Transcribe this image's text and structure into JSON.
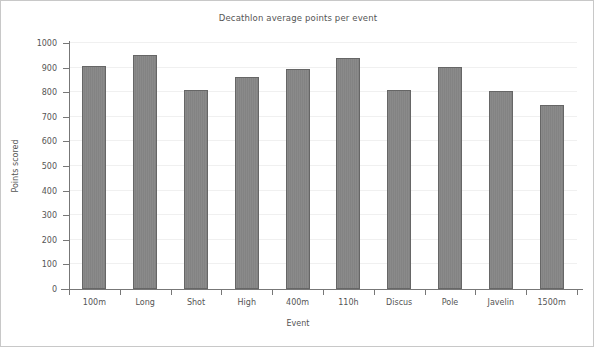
{
  "chart_data": {
    "type": "bar",
    "title": "Decathlon average points per event",
    "xlabel": "Event",
    "ylabel": "Points scored",
    "categories": [
      "100m",
      "Long",
      "Shot",
      "High",
      "400m",
      "110h",
      "Discus",
      "Pole",
      "Javelin",
      "1500m"
    ],
    "values": [
      907,
      952,
      810,
      862,
      896,
      940,
      808,
      902,
      803,
      747
    ],
    "ylim": [
      0,
      1000
    ],
    "yticks": [
      0,
      100,
      200,
      300,
      400,
      500,
      600,
      700,
      800,
      900,
      1000
    ],
    "ytick_labels": [
      "0",
      "100",
      "200",
      "300",
      "400",
      "500",
      "600",
      "700",
      "800",
      "900",
      "1000"
    ],
    "grid": true,
    "legend": null,
    "bar_color": "#858585",
    "bar_edge_color": "#666666",
    "axis_color": "#777777",
    "grid_color": "#f0f0f0",
    "text_color": "#555555",
    "background_color": "#ffffff",
    "frame_color": "#c8c8c8"
  }
}
